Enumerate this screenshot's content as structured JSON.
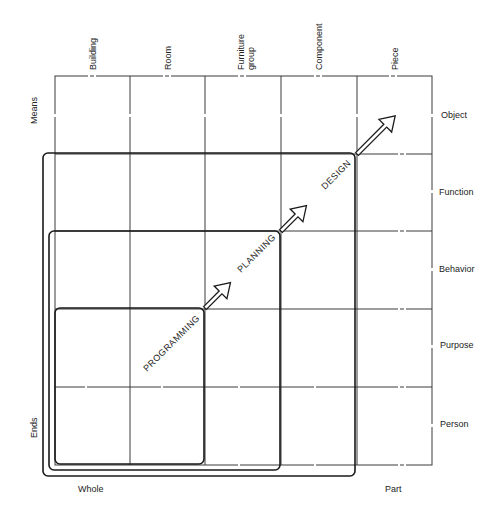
{
  "diagram": {
    "columns": [
      "Building",
      "Room",
      "Furniture group",
      "Component",
      "Piece"
    ],
    "column_lines": [
      [
        "Building"
      ],
      [
        "Room"
      ],
      [
        "Furniture",
        "group"
      ],
      [
        "Component"
      ],
      [
        "Piece"
      ]
    ],
    "rows": [
      "Object",
      "Function",
      "Behavior",
      "Purpose",
      "Person"
    ],
    "axis_labels": {
      "left_top": "Means",
      "left_bottom": "Ends",
      "bottom_left": "Whole",
      "bottom_right": "Part"
    },
    "stages": [
      "PROGRAMMING",
      "PLANNING",
      "DESIGN"
    ],
    "colors": {
      "line": "#1a1a1a",
      "background": "#ffffff"
    }
  }
}
